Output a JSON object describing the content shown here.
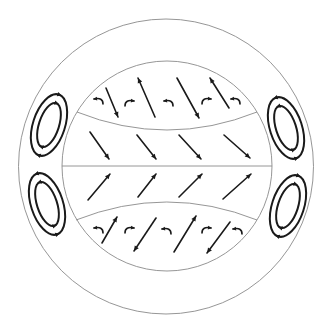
{
  "diagram": {
    "type": "atmospheric-circulation-cross-section",
    "outer_circle": {
      "cx": 166,
      "cy": 166.5,
      "r": 147.5
    },
    "inner_circle": {
      "cx": 167,
      "cy": 166,
      "r": 105
    },
    "equator_line": {
      "x1": 62,
      "y1": 166,
      "x2": 272,
      "y2": 166
    },
    "upper_divider": {
      "x1": 77,
      "y1": 112,
      "cx": 167,
      "cy": 148,
      "x2": 257,
      "y2": 112
    },
    "lower_divider": {
      "x1": 76,
      "y1": 220,
      "cx": 167,
      "cy": 184,
      "x2": 257,
      "y2": 220
    },
    "line_colors": {
      "thin": "#8a8a8a",
      "thick": "#1a1a1a"
    },
    "straight_arrows": [
      {
        "region": "upper-band",
        "x1": 106,
        "y1": 88,
        "x2": 118,
        "y2": 117
      },
      {
        "region": "upper-band",
        "x1": 155,
        "y1": 117,
        "x2": 138,
        "y2": 78
      },
      {
        "region": "upper-band",
        "x1": 177,
        "y1": 78,
        "x2": 199,
        "y2": 118
      },
      {
        "region": "upper-band",
        "x1": 229,
        "y1": 108,
        "x2": 210,
        "y2": 78
      },
      {
        "region": "upper-middle",
        "x1": 90,
        "y1": 132,
        "x2": 109,
        "y2": 159
      },
      {
        "region": "upper-middle",
        "x1": 137,
        "y1": 135,
        "x2": 156,
        "y2": 159
      },
      {
        "region": "upper-middle",
        "x1": 179,
        "y1": 135,
        "x2": 201,
        "y2": 159
      },
      {
        "region": "upper-middle",
        "x1": 224,
        "y1": 135,
        "x2": 250,
        "y2": 158
      },
      {
        "region": "lower-middle",
        "x1": 88,
        "y1": 200,
        "x2": 110,
        "y2": 174
      },
      {
        "region": "lower-middle",
        "x1": 138,
        "y1": 197,
        "x2": 156,
        "y2": 174
      },
      {
        "region": "lower-middle",
        "x1": 179,
        "y1": 197,
        "x2": 202,
        "y2": 174
      },
      {
        "region": "lower-middle",
        "x1": 223,
        "y1": 199,
        "x2": 251,
        "y2": 174
      },
      {
        "region": "lower-band",
        "x1": 102,
        "y1": 243,
        "x2": 117,
        "y2": 217
      },
      {
        "region": "lower-band",
        "x1": 156,
        "y1": 218,
        "x2": 134,
        "y2": 251
      },
      {
        "region": "lower-band",
        "x1": 174,
        "y1": 252,
        "x2": 196,
        "y2": 216
      },
      {
        "region": "lower-band",
        "x1": 230,
        "y1": 222,
        "x2": 207,
        "y2": 253
      }
    ],
    "curl_arrows": [
      {
        "region": "upper-band",
        "x": 98,
        "y": 100,
        "dir": "left"
      },
      {
        "region": "upper-band",
        "x": 130,
        "y": 102,
        "dir": "right"
      },
      {
        "region": "upper-band",
        "x": 168,
        "y": 102,
        "dir": "left"
      },
      {
        "region": "upper-band",
        "x": 207,
        "y": 100,
        "dir": "right"
      },
      {
        "region": "upper-band",
        "x": 235,
        "y": 100,
        "dir": "left"
      },
      {
        "region": "lower-band",
        "x": 98,
        "y": 229,
        "dir": "left"
      },
      {
        "region": "lower-band",
        "x": 130,
        "y": 229,
        "dir": "right"
      },
      {
        "region": "lower-band",
        "x": 166,
        "y": 230,
        "dir": "left"
      },
      {
        "region": "lower-band",
        "x": 207,
        "y": 229,
        "dir": "right"
      },
      {
        "region": "lower-band",
        "x": 237,
        "y": 230,
        "dir": "left"
      }
    ],
    "vortices": [
      {
        "name": "upper-left",
        "cx": 49,
        "cy": 125,
        "rx_outer": 16,
        "ry_outer": 32,
        "rx_inner": 10,
        "ry_inner": 23,
        "tilt": 18,
        "rotation": "clockwise"
      },
      {
        "name": "lower-left",
        "cx": 47,
        "cy": 204,
        "rx_outer": 16,
        "ry_outer": 32,
        "rx_inner": 10,
        "ry_inner": 23,
        "tilt": -18,
        "rotation": "counterclockwise"
      },
      {
        "name": "upper-right",
        "cx": 286,
        "cy": 128,
        "rx_outer": 16,
        "ry_outer": 32,
        "rx_inner": 10,
        "ry_inner": 23,
        "tilt": -18,
        "rotation": "counterclockwise"
      },
      {
        "name": "lower-right",
        "cx": 288,
        "cy": 206,
        "rx_outer": 16,
        "ry_outer": 32,
        "rx_inner": 10,
        "ry_inner": 23,
        "tilt": 18,
        "rotation": "clockwise"
      }
    ]
  }
}
